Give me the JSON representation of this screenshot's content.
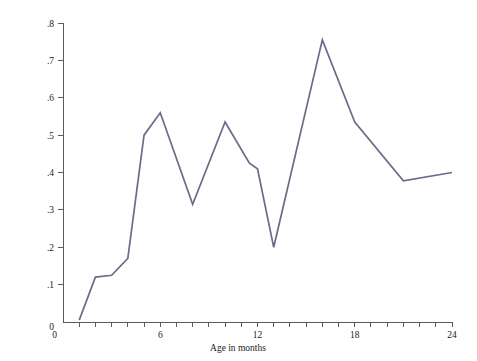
{
  "chart_data": {
    "type": "line",
    "title": "",
    "xlabel": "Age in months",
    "ylabel": "Stability of test scores",
    "xlim": [
      0,
      24
    ],
    "ylim": [
      0,
      0.8
    ],
    "grid": false,
    "legend": false,
    "line_color": "#6b6b8a",
    "axis_color": "#5a5a5a",
    "x_tick_labels": [
      "0",
      "6",
      "12",
      "18",
      "24"
    ],
    "x_tick_values": [
      0,
      6,
      12,
      18,
      24
    ],
    "x_minor_ticks": [
      1,
      2,
      3,
      4,
      5,
      7,
      8,
      9,
      10,
      11,
      13,
      14,
      15,
      16,
      17,
      19,
      20,
      21,
      22,
      23
    ],
    "y_tick_labels": [
      "0",
      ".1",
      ".2",
      ".3",
      ".4",
      ".5",
      ".6",
      ".7",
      ".8"
    ],
    "y_tick_values": [
      0,
      0.1,
      0.2,
      0.3,
      0.4,
      0.5,
      0.6,
      0.7,
      0.8
    ],
    "x": [
      1,
      2,
      3,
      4,
      5,
      6,
      8,
      10,
      11.5,
      12,
      13,
      16,
      18,
      21,
      24
    ],
    "values": [
      0.005,
      0.12,
      0.125,
      0.17,
      0.5,
      0.56,
      0.315,
      0.535,
      0.425,
      0.41,
      0.2,
      0.755,
      0.535,
      0.378,
      0.4
    ],
    "series": [
      {
        "name": "Stability of test scores",
        "points": [
          [
            1,
            0.005
          ],
          [
            2,
            0.12
          ],
          [
            3,
            0.125
          ],
          [
            4,
            0.17
          ],
          [
            5,
            0.5
          ],
          [
            6,
            0.56
          ],
          [
            8,
            0.315
          ],
          [
            10,
            0.535
          ],
          [
            11.5,
            0.425
          ],
          [
            12,
            0.41
          ],
          [
            13,
            0.2
          ],
          [
            16,
            0.755
          ],
          [
            18,
            0.535
          ],
          [
            21,
            0.378
          ],
          [
            24,
            0.4
          ]
        ]
      }
    ]
  }
}
